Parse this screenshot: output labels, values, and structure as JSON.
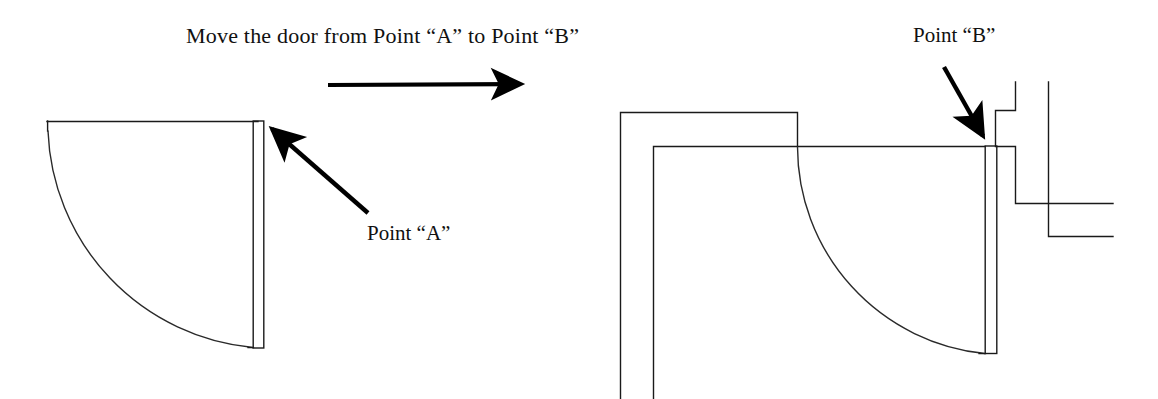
{
  "page": {
    "width": 1158,
    "height": 399,
    "background_color": "#ffffff",
    "ink_color": "#1a1a1a",
    "arrow_color": "#000000"
  },
  "title": {
    "text": "Move the door from Point “A” to Point “B”"
  },
  "labels": {
    "point_a": "Point “A”",
    "point_b": "Point “B”"
  },
  "icons": {
    "transition_arrow": "right-arrow-icon",
    "pointer_a": "arrow-pointer-up-left-icon",
    "pointer_b": "arrow-pointer-down-right-icon"
  },
  "diagram": {
    "type": "architectural-floor-plan",
    "before": {
      "name": "door-at-point-a",
      "door_leaf": {
        "x1": 253,
        "y1": 121,
        "x2": 264,
        "y2": 348
      },
      "swing_arc": {
        "start_x": 48,
        "start_y": 131,
        "end_x": 253,
        "end_y": 347,
        "radius": 226
      },
      "head_line": {
        "x1": 47,
        "y1": 121,
        "x2": 258,
        "y2": 121
      },
      "jamb_line": {
        "x1": 47,
        "y1": 121,
        "x2": 47,
        "y2": 131
      }
    },
    "after": {
      "name": "door-at-point-b",
      "outer_wall": {
        "x1": 620,
        "y1": 388,
        "corner_x": 620,
        "corner_y": 112,
        "x2": 797,
        "y2": 112,
        "drop_y": 146
      },
      "inner_wall": {
        "x1": 653,
        "y1": 388,
        "corner_x": 653,
        "corner_y": 146,
        "x2": 985,
        "y2": 146
      },
      "door_leaf": {
        "x1": 985,
        "y1": 146,
        "x2": 997,
        "y2": 354
      },
      "swing_arc": {
        "start_x": 797,
        "start_y": 146,
        "end_x": 985,
        "end_y": 353,
        "radius": 208
      },
      "wall_jog": {
        "upper_return_x": 1015,
        "upper_return_top": 82,
        "upper_return_bottom": 110,
        "notch_left_x": 995,
        "notch_top_y": 110,
        "notch_bottom_y": 146,
        "inner_return_x": 1015,
        "inner_return_bottom": 204,
        "outer_return_x": 1048,
        "outer_return_top": 82,
        "outer_return_bottom": 202,
        "right_edge_x": 1113
      }
    },
    "transition_arrow": {
      "x1": 328,
      "y1": 85,
      "x2": 528,
      "y2": 84
    },
    "pointer_a": {
      "tail_x": 368,
      "tail_y": 213,
      "tip_x": 264,
      "tip_y": 122
    },
    "pointer_b": {
      "tail_x": 944,
      "tail_y": 67,
      "tip_x": 988,
      "tip_y": 145
    }
  }
}
